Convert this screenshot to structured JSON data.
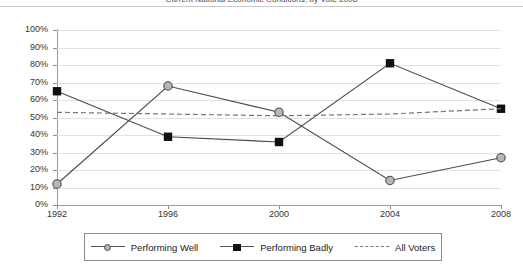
{
  "chart": {
    "title": "Current National Economic Conditions, by Vote 2008",
    "title_visible_note": "clipped at top edge"
  },
  "legend": {
    "items": [
      {
        "label": "Performing Well",
        "marker": "circle-marker",
        "style": "solid"
      },
      {
        "label": "Performing Badly",
        "marker": "square-marker",
        "style": "solid"
      },
      {
        "label": "All Voters",
        "marker": "dashed-line",
        "style": "dashed"
      }
    ]
  },
  "axes": {
    "y_ticks": [
      "100%",
      "90%",
      "80%",
      "70%",
      "60%",
      "50%",
      "40%",
      "30%",
      "20%",
      "10%",
      "0%"
    ],
    "x_ticks": [
      "1992",
      "1996",
      "2000",
      "2004",
      "2008"
    ]
  },
  "colors": {
    "performing_well": "#b6b6b6",
    "performing_badly": "#111111",
    "all_voters": "#777777",
    "gridline": "#e2e2e2",
    "axis": "#9a9a9a",
    "background": "#ffffff"
  },
  "chart_data": {
    "type": "line",
    "title": "Current National Economic Conditions, by Vote 2008",
    "xlabel": "",
    "ylabel": "",
    "x": [
      "1992",
      "1996",
      "2000",
      "2004",
      "2008"
    ],
    "categories": [
      "1992",
      "1996",
      "2000",
      "2004",
      "2008"
    ],
    "ylim": [
      0,
      100
    ],
    "ytick_step": 10,
    "ytick_format": "percent",
    "grid": true,
    "legend_position": "bottom",
    "series": [
      {
        "name": "Performing Well",
        "values": [
          12,
          68,
          53,
          14,
          27
        ],
        "marker": "circle",
        "linestyle": "solid"
      },
      {
        "name": "Performing Badly",
        "values": [
          65,
          39,
          36,
          81,
          55
        ],
        "marker": "square",
        "linestyle": "solid"
      },
      {
        "name": "All Voters",
        "values": [
          53,
          52,
          51,
          52,
          55
        ],
        "marker": "none",
        "linestyle": "dashed"
      }
    ]
  }
}
